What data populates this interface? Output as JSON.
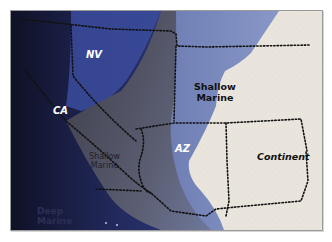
{
  "figure": {
    "type": "paleogeographic-map",
    "colors": {
      "deep_marine": "#181b3a",
      "deep_marine_mid": "#2f3f8a",
      "shallow_marine_dark": "#4b4b58",
      "shallow_marine": "#7f8fc0",
      "shallow_marine_light": "#8c9bcc",
      "continent": "#e9e4dc",
      "boundary": "#111111",
      "frame_border": "#9a9a9a"
    }
  },
  "labels": {
    "nv": "NV",
    "ca": "CA",
    "az": "AZ",
    "shallow_marine_north": [
      "Shallow",
      "Marine"
    ],
    "shallow_marine_south": [
      "Shallow",
      "Marine"
    ],
    "continent": "Continent",
    "deep_marine": [
      "Deep",
      "Marine"
    ]
  }
}
